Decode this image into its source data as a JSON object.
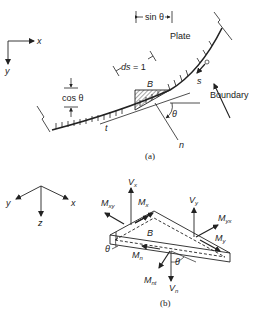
{
  "figure_a": {
    "axes": {
      "x_label": "x",
      "y_label": "y"
    },
    "labels": {
      "sin_theta": "sin θ",
      "plate": "Plate",
      "ds": "ds = 1",
      "cos_theta": "cos θ",
      "B": "B",
      "s": "s",
      "boundary": "Boundary",
      "t": "t",
      "n": "n",
      "theta": "θ"
    },
    "caption": "(a)"
  },
  "figure_b": {
    "axes": {
      "x_label": "x",
      "y_label": "y",
      "z_label": "z"
    },
    "labels": {
      "B": "B",
      "theta_left": "θ",
      "theta_right": "θ",
      "Vx": {
        "main": "V",
        "sub": "x"
      },
      "Vy": {
        "main": "V",
        "sub": "y"
      },
      "Vn": {
        "main": "V",
        "sub": "n"
      },
      "Mx": {
        "main": "M",
        "sub": "x"
      },
      "My": {
        "main": "M",
        "sub": "y"
      },
      "Mxy": {
        "main": "M",
        "sub": "xy"
      },
      "Myx": {
        "main": "M",
        "sub": "yx"
      },
      "Mn": {
        "main": "M",
        "sub": "n"
      },
      "Mnt": {
        "main": "M",
        "sub": "nt"
      }
    },
    "caption": "(b)"
  },
  "colors": {
    "ink": "#222222",
    "background": "#ffffff"
  }
}
